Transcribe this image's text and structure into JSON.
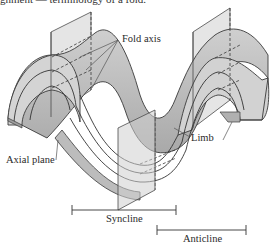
{
  "figure": {
    "caption_fragment": "gnment — terminology of a fold.",
    "labels": {
      "fold_axis": "Fold axis",
      "axial_plane": "Axial plane",
      "limb": "Limb",
      "syncline": "Syncline",
      "anticline": "Anticline"
    },
    "colors": {
      "surface_light": "#d9d9d9",
      "surface_mid": "#bdbdbd",
      "surface_dark": "#a3a3a3",
      "plane_fill": "#c8c8c8",
      "line": "#3a3a3a",
      "background": "#ffffff"
    }
  }
}
